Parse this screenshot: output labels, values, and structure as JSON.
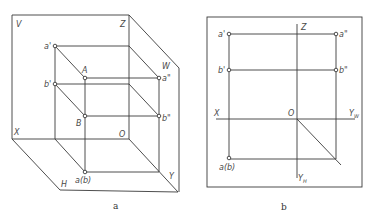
{
  "figure_a": {
    "caption": "a",
    "labels": {
      "V": "V",
      "Z": "Z",
      "W": "W",
      "X": "X",
      "O": "O",
      "H": "H",
      "Y": "Y",
      "a_prime": "a'",
      "b_prime": "b'",
      "A": "A",
      "B": "B",
      "a_dprime": "a\"",
      "b_dprime": "b\"",
      "ab": "a(b)"
    }
  },
  "figure_b": {
    "caption": "b",
    "labels": {
      "Z": "Z",
      "X": "X",
      "O": "O",
      "YW": "Y",
      "YW_sub": "W",
      "YH": "Y",
      "YH_sub": "H",
      "a_prime": "a'",
      "b_prime": "b'",
      "a_dprime": "a\"",
      "b_dprime": "b\"",
      "ab": "a(b)"
    }
  },
  "colors": {
    "line": "#3a3a3a",
    "background": "#ffffff"
  }
}
